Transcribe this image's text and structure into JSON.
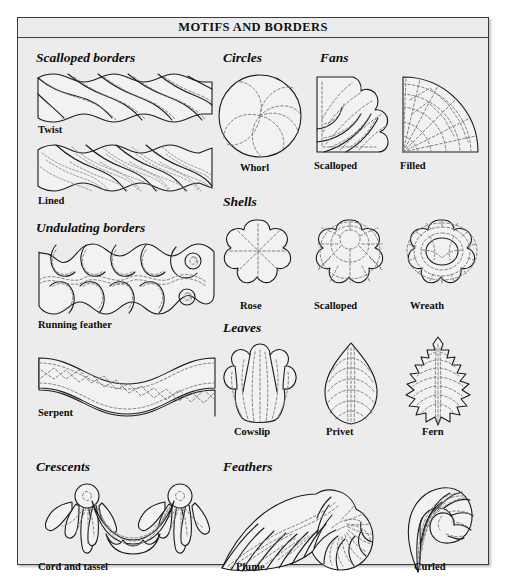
{
  "plate": {
    "title": "MOTIFS AND BORDERS",
    "background_color": "#ececed",
    "border_color": "#3a3a3a",
    "solid_line_color": "#1b1b1b",
    "dashed_line_color": "#7c7c80"
  },
  "groups": [
    {
      "id": "scalloped-borders",
      "title": "Scalloped borders",
      "items": [
        {
          "id": "twist",
          "caption": "Twist"
        },
        {
          "id": "lined",
          "caption": "Lined"
        }
      ]
    },
    {
      "id": "undulating-borders",
      "title": "Undulating borders",
      "items": [
        {
          "id": "running-feather",
          "caption": "Running feather"
        },
        {
          "id": "serpent",
          "caption": "Serpent"
        }
      ]
    },
    {
      "id": "crescents",
      "title": "Crescents",
      "items": [
        {
          "id": "cord-and-tassel",
          "caption": "Cord and tassel"
        }
      ]
    },
    {
      "id": "circles",
      "title": "Circles",
      "items": [
        {
          "id": "whorl",
          "caption": "Whorl"
        }
      ]
    },
    {
      "id": "fans",
      "title": "Fans",
      "items": [
        {
          "id": "fan-scalloped",
          "caption": "Scalloped"
        },
        {
          "id": "fan-filled",
          "caption": "Filled"
        }
      ]
    },
    {
      "id": "shells",
      "title": "Shells",
      "items": [
        {
          "id": "shell-rose",
          "caption": "Rose"
        },
        {
          "id": "shell-scalloped",
          "caption": "Scalloped"
        },
        {
          "id": "shell-wreath",
          "caption": "Wreath"
        }
      ]
    },
    {
      "id": "leaves",
      "title": "Leaves",
      "items": [
        {
          "id": "cowslip",
          "caption": "Cowslip"
        },
        {
          "id": "privet",
          "caption": "Privet"
        },
        {
          "id": "fern",
          "caption": "Fern"
        }
      ]
    },
    {
      "id": "feathers",
      "title": "Feathers",
      "items": [
        {
          "id": "plume",
          "caption": "Plume"
        },
        {
          "id": "curled",
          "caption": "Curled"
        }
      ]
    }
  ]
}
